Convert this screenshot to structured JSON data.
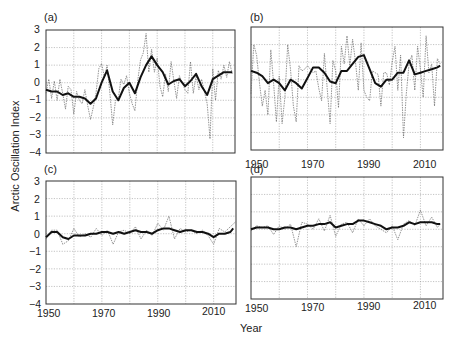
{
  "chart_data": [
    {
      "panel": "(a)",
      "type": "line",
      "xlabel": "Year",
      "ylabel": "Arctic Oscillation Index",
      "xlim": [
        1950,
        2018
      ],
      "ylim": [
        -4,
        3
      ],
      "yticks": [
        3,
        2,
        1,
        0,
        -1,
        -2,
        -3,
        -4
      ],
      "xticks": [],
      "grid": true,
      "series": [
        {
          "name": "annual",
          "style": "dashed",
          "x": [
            1950,
            1951,
            1952,
            1953,
            1954,
            1955,
            1956,
            1957,
            1958,
            1959,
            1960,
            1961,
            1962,
            1963,
            1964,
            1965,
            1966,
            1967,
            1968,
            1969,
            1970,
            1971,
            1972,
            1973,
            1974,
            1975,
            1976,
            1977,
            1978,
            1979,
            1980,
            1981,
            1982,
            1983,
            1984,
            1985,
            1986,
            1987,
            1988,
            1989,
            1990,
            1991,
            1992,
            1993,
            1994,
            1995,
            1996,
            1997,
            1998,
            1999,
            2000,
            2001,
            2002,
            2003,
            2004,
            2005,
            2006,
            2007,
            2008,
            2009,
            2010,
            2011,
            2012,
            2013,
            2014,
            2015,
            2016,
            2017
          ],
          "values": [
            -0.6,
            0.2,
            -0.9,
            0.1,
            -1.0,
            0.2,
            -0.6,
            -1.5,
            -0.2,
            -0.4,
            -1.8,
            -0.5,
            -1.0,
            -1.2,
            -0.4,
            -1.3,
            -2.1,
            -1.4,
            -0.6,
            0.8,
            1.1,
            0.3,
            1.0,
            -0.6,
            -2.4,
            -1.0,
            -0.9,
            0.2,
            -0.1,
            0.4,
            -0.6,
            -1.2,
            -1.6,
            0.1,
            1.3,
            1.7,
            2.8,
            0.6,
            1.9,
            0.6,
            1.4,
            -0.2,
            -0.8,
            0.5,
            -0.5,
            1.2,
            0.1,
            -0.9,
            0.4,
            0.0,
            -0.4,
            -0.6,
            1.2,
            -0.6,
            0.4,
            -0.4,
            0.2,
            -0.5,
            -1.2,
            -3.2,
            0.8,
            -1.0,
            0.7,
            0.2,
            1.0,
            0.3,
            1.2,
            0.5
          ]
        },
        {
          "name": "smoothed",
          "style": "solid",
          "x": [
            1950,
            1952,
            1954,
            1956,
            1958,
            1960,
            1962,
            1964,
            1966,
            1968,
            1970,
            1972,
            1974,
            1976,
            1978,
            1980,
            1982,
            1984,
            1986,
            1988,
            1990,
            1992,
            1994,
            1996,
            1998,
            2000,
            2002,
            2004,
            2006,
            2008,
            2010,
            2012,
            2014,
            2016,
            2017
          ],
          "values": [
            -0.4,
            -0.5,
            -0.5,
            -0.7,
            -0.6,
            -0.8,
            -0.8,
            -0.9,
            -1.2,
            -0.9,
            0.0,
            0.7,
            -0.5,
            -1.0,
            -0.3,
            0.0,
            -0.6,
            0.3,
            1.0,
            1.5,
            1.0,
            0.6,
            -0.1,
            0.1,
            0.2,
            -0.2,
            0.1,
            0.5,
            -0.2,
            -0.7,
            0.2,
            0.4,
            0.6,
            0.6,
            0.6
          ]
        }
      ]
    },
    {
      "panel": "(b)",
      "type": "line",
      "xlim": [
        1950,
        2018
      ],
      "ylim": [
        -4,
        3
      ],
      "xticks": [
        1950,
        1970,
        1990,
        2010
      ],
      "grid": true,
      "series": [
        {
          "name": "annual",
          "style": "dashed",
          "x": [
            1950,
            1951,
            1952,
            1953,
            1954,
            1955,
            1956,
            1957,
            1958,
            1959,
            1960,
            1961,
            1962,
            1963,
            1964,
            1965,
            1966,
            1967,
            1968,
            1969,
            1970,
            1971,
            1972,
            1973,
            1974,
            1975,
            1976,
            1977,
            1978,
            1979,
            1980,
            1981,
            1982,
            1983,
            1984,
            1985,
            1986,
            1987,
            1988,
            1989,
            1990,
            1991,
            1992,
            1993,
            1994,
            1995,
            1996,
            1997,
            1998,
            1999,
            2000,
            2001,
            2002,
            2003,
            2004,
            2005,
            2006,
            2007,
            2008,
            2009,
            2010,
            2011,
            2012,
            2013,
            2014,
            2015,
            2016,
            2017
          ],
          "values": [
            -0.8,
            2.0,
            1.4,
            -0.2,
            -1.5,
            -0.6,
            -2.0,
            1.7,
            -0.2,
            -2.4,
            0.2,
            -2.5,
            -1.0,
            2.0,
            0.6,
            -1.5,
            -2.4,
            0.8,
            0.5,
            0.6,
            0.8,
            0.6,
            0.4,
            0.5,
            -0.5,
            -1.2,
            1.5,
            -0.5,
            -2.5,
            1.1,
            0.5,
            -1.6,
            1.9,
            0.9,
            2.5,
            0.8,
            2.3,
            1.0,
            -0.6,
            2.1,
            -0.6,
            -1.0,
            -1.2,
            0.5,
            0.4,
            0.3,
            -1.5,
            0.4,
            0.4,
            -0.3,
            1.0,
            1.9,
            -0.6,
            1.4,
            -3.3,
            -0.8,
            0.9,
            1.4,
            -0.6,
            1.9,
            0.6,
            -1.0,
            2.5,
            0.4,
            0.9,
            -1.5,
            1.2,
            0.9
          ]
        },
        {
          "name": "smoothed",
          "style": "solid",
          "x": [
            1950,
            1952,
            1954,
            1956,
            1958,
            1960,
            1962,
            1964,
            1966,
            1968,
            1970,
            1972,
            1974,
            1976,
            1978,
            1980,
            1982,
            1984,
            1986,
            1988,
            1990,
            1992,
            1994,
            1996,
            1998,
            2000,
            2002,
            2004,
            2006,
            2008,
            2010,
            2012,
            2014,
            2016,
            2017
          ],
          "values": [
            0.5,
            0.4,
            0.2,
            -0.2,
            0.0,
            -0.2,
            -0.6,
            0.0,
            -0.2,
            -0.5,
            0.1,
            0.7,
            0.7,
            0.4,
            -0.1,
            -0.2,
            0.5,
            0.5,
            0.9,
            1.3,
            1.4,
            0.6,
            -0.2,
            -0.4,
            0.0,
            0.0,
            0.4,
            0.4,
            1.1,
            0.3,
            0.4,
            0.5,
            0.6,
            0.7,
            0.8
          ]
        }
      ]
    },
    {
      "panel": "(c)",
      "type": "line",
      "xlim": [
        1950,
        2018
      ],
      "ylim": [
        -4,
        3
      ],
      "yticks": [
        3,
        2,
        1,
        0,
        -1,
        -2,
        -3,
        -4
      ],
      "xticks": [
        1950,
        1970,
        1990,
        2010
      ],
      "grid": true,
      "series": [
        {
          "name": "annual",
          "style": "dashed",
          "x": [
            1950,
            1952,
            1954,
            1956,
            1958,
            1960,
            1962,
            1964,
            1966,
            1968,
            1970,
            1972,
            1974,
            1976,
            1978,
            1980,
            1982,
            1984,
            1986,
            1988,
            1990,
            1992,
            1994,
            1996,
            1998,
            2000,
            2002,
            2004,
            2006,
            2008,
            2010,
            2012,
            2014,
            2016,
            2018
          ],
          "values": [
            -0.3,
            0.2,
            0.2,
            -0.6,
            -0.4,
            0.3,
            -0.2,
            0.0,
            -0.2,
            0.3,
            -0.1,
            0.2,
            -0.6,
            0.1,
            0.2,
            0.0,
            0.4,
            -0.3,
            0.2,
            -0.1,
            0.6,
            0.2,
            1.0,
            -0.3,
            0.3,
            0.1,
            0.2,
            0.0,
            0.2,
            -0.1,
            -0.6,
            0.3,
            0.1,
            0.4,
            0.7
          ]
        },
        {
          "name": "smoothed",
          "style": "solid",
          "x": [
            1950,
            1952,
            1954,
            1956,
            1958,
            1960,
            1962,
            1964,
            1966,
            1968,
            1970,
            1972,
            1974,
            1976,
            1978,
            1980,
            1982,
            1984,
            1986,
            1988,
            1990,
            1992,
            1994,
            1996,
            1998,
            2000,
            2002,
            2004,
            2006,
            2008,
            2010,
            2012,
            2014,
            2016,
            2017
          ],
          "values": [
            -0.2,
            0.1,
            0.1,
            -0.2,
            -0.3,
            -0.1,
            -0.1,
            -0.1,
            0.0,
            0.0,
            0.1,
            0.1,
            0.0,
            0.1,
            0.0,
            0.1,
            0.2,
            0.1,
            0.1,
            0.0,
            0.2,
            0.3,
            0.3,
            0.2,
            0.1,
            0.2,
            0.2,
            0.1,
            0.1,
            0.0,
            -0.2,
            0.0,
            0.0,
            0.1,
            0.3
          ]
        }
      ]
    },
    {
      "panel": "(d)",
      "type": "line",
      "xlim": [
        1950,
        2018
      ],
      "ylim": [
        -4,
        3
      ],
      "xticks": [
        1950,
        1970,
        1990,
        2010
      ],
      "grid": true,
      "series": [
        {
          "name": "annual",
          "style": "dashed",
          "x": [
            1950,
            1952,
            1954,
            1956,
            1958,
            1960,
            1962,
            1964,
            1966,
            1968,
            1970,
            1972,
            1974,
            1976,
            1978,
            1980,
            1982,
            1984,
            1986,
            1988,
            1990,
            1992,
            1994,
            1996,
            1998,
            2000,
            2002,
            2004,
            2006,
            2008,
            2010,
            2012,
            2014,
            2016,
            2017
          ],
          "values": [
            -0.1,
            0.2,
            0.1,
            0.2,
            -0.3,
            0.2,
            0.0,
            0.3,
            -1.0,
            0.4,
            0.3,
            0.0,
            0.6,
            -0.1,
            0.8,
            -0.4,
            0.3,
            0.4,
            -0.2,
            0.6,
            0.2,
            0.6,
            0.2,
            0.0,
            -0.2,
            0.2,
            -0.6,
            0.3,
            0.5,
            0.2,
            1.1,
            0.2,
            0.7,
            0.1,
            0.3
          ]
        },
        {
          "name": "smoothed",
          "style": "solid",
          "x": [
            1950,
            1952,
            1954,
            1956,
            1958,
            1960,
            1962,
            1964,
            1966,
            1968,
            1970,
            1972,
            1974,
            1976,
            1978,
            1980,
            1982,
            1984,
            1986,
            1988,
            1990,
            1992,
            1994,
            1996,
            1998,
            2000,
            2002,
            2004,
            2006,
            2008,
            2010,
            2012,
            2014,
            2016,
            2017
          ],
          "values": [
            0.0,
            0.1,
            0.1,
            0.1,
            0.0,
            0.0,
            0.1,
            0.1,
            0.0,
            0.1,
            0.2,
            0.2,
            0.3,
            0.3,
            0.4,
            0.1,
            0.2,
            0.3,
            0.3,
            0.5,
            0.5,
            0.4,
            0.3,
            0.2,
            0.0,
            0.1,
            0.1,
            0.2,
            0.4,
            0.3,
            0.4,
            0.4,
            0.4,
            0.3,
            0.3
          ]
        }
      ]
    }
  ],
  "labels": {
    "panel_a": "(a)",
    "panel_b": "(b)",
    "panel_c": "(c)",
    "panel_d": "(d)",
    "ylabel": "Arctic Oscillation Index",
    "xlabel": "Year",
    "yticks": [
      "3",
      "2",
      "1",
      "0",
      "-1",
      "-2",
      "-3",
      "-4"
    ],
    "xticks": [
      "1950",
      "1970",
      "1990",
      "2010"
    ]
  }
}
